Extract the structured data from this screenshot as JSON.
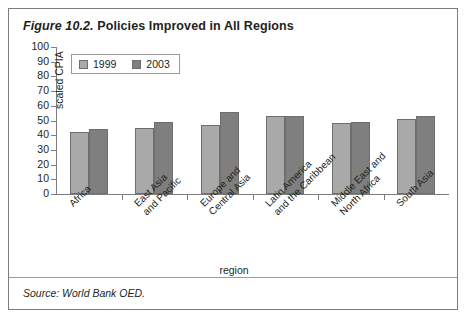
{
  "figure": {
    "number": "Figure 10.2.",
    "title": "Policies Improved in All Regions",
    "source": "Source: World Bank OED."
  },
  "chart_data": {
    "type": "bar",
    "title": "Policies Improved in All Regions",
    "xlabel": "region",
    "ylabel": "scaled CPIA",
    "ylim": [
      0,
      100
    ],
    "yticks": [
      0,
      10,
      20,
      30,
      40,
      50,
      60,
      70,
      80,
      90,
      100
    ],
    "grid": false,
    "legend_position": "top-left",
    "categories": [
      "Africa",
      "East Asia and Pacific",
      "Europe and Central Asia",
      "Latin America and the Caribbean",
      "Middle East and North Africa",
      "South Asia"
    ],
    "category_lines": [
      [
        "Africa"
      ],
      [
        "East Asia",
        "and Pacific"
      ],
      [
        "Europe and",
        "Central Asia"
      ],
      [
        "Latin America",
        "and the Caribbean"
      ],
      [
        "Middle East and",
        "North Africa"
      ],
      [
        "South Asia"
      ]
    ],
    "series": [
      {
        "name": "1999",
        "color": "#a9a9a9",
        "values": [
          42,
          45,
          47,
          53,
          48,
          51
        ]
      },
      {
        "name": "2003",
        "color": "#7f7f7f",
        "values": [
          44,
          49,
          56,
          53,
          49,
          53
        ]
      }
    ]
  }
}
